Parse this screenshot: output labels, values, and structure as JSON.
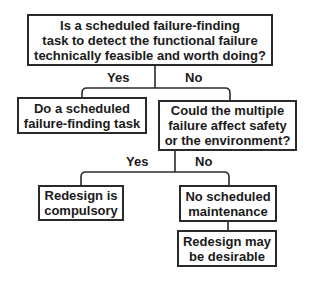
{
  "diagram": {
    "type": "decision-flowchart",
    "nodes": {
      "q1": {
        "text": "Is a scheduled failure-finding\ntask to detect the functional failure\ntechnically feasible and worth doing?"
      },
      "a1": {
        "text": "Do a scheduled\nfailure-finding task"
      },
      "q2": {
        "text": "Could the multiple\nfailure affect safety\nor the environment?"
      },
      "a2": {
        "text": "Redesign is\ncompulsory"
      },
      "a3": {
        "text": "No scheduled\nmaintenance"
      },
      "a4": {
        "text": "Redesign may\nbe desirable"
      }
    },
    "edges": {
      "q1_yes": {
        "from": "q1",
        "to": "a1",
        "label": "Yes"
      },
      "q1_no": {
        "from": "q1",
        "to": "q2",
        "label": "No"
      },
      "q2_yes": {
        "from": "q2",
        "to": "a2",
        "label": "Yes"
      },
      "q2_no": {
        "from": "q2",
        "to": "a3",
        "label": "No"
      },
      "a3_next": {
        "from": "a3",
        "to": "a4",
        "label": ""
      }
    },
    "colors": {
      "stroke": "#2a2a2a",
      "text": "#1a1a1a",
      "background": "#ffffff"
    }
  }
}
